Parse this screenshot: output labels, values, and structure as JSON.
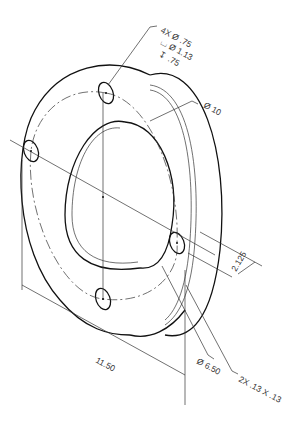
{
  "drawing": {
    "type": "isometric engineering drawing of flanged ring with counterbored holes",
    "line_color": "#111111",
    "thin_line_color": "#333333",
    "background": "#ffffff"
  },
  "callouts": {
    "hole_count_dia": "4X Ø .75",
    "counterbore": "⌴ Ø 1.13",
    "depth": "↧ .75",
    "outer_dia": "Ø 10",
    "thickness": "2.125",
    "overall": "11.50",
    "inner_dia": "Ø 6.50",
    "chamfer": "2X .13 X .13"
  }
}
